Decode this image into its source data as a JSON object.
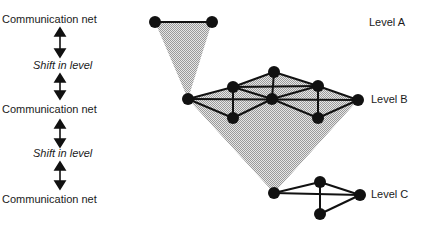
{
  "left_column": {
    "labels": [
      {
        "text": "Communication net",
        "style": "normal"
      },
      {
        "text": "Shift in level",
        "style": "italic"
      },
      {
        "text": "Communication net",
        "style": "normal"
      },
      {
        "text": "Shift in level",
        "style": "italic"
      },
      {
        "text": "Communication net",
        "style": "normal"
      }
    ],
    "arrow_icon": "double-headed-vertical-arrow"
  },
  "levels": [
    {
      "label": "Level A"
    },
    {
      "label": "Level B"
    },
    {
      "label": "Level C"
    }
  ],
  "colors": {
    "node": "#111111",
    "edge": "#111111",
    "shade": "#c8c8c8",
    "text": "#1a1a1a"
  },
  "networks": {
    "level_a": {
      "nodes": [
        [
          155,
          22
        ],
        [
          212,
          22
        ]
      ],
      "edges": [
        [
          0,
          1
        ]
      ]
    },
    "level_b": {
      "nodes": {
        "L": [
          188,
          99
        ],
        "TL": [
          233,
          87
        ],
        "BL": [
          233,
          118
        ],
        "T": [
          274,
          72
        ],
        "C": [
          272,
          99
        ],
        "TR": [
          318,
          86
        ],
        "BR": [
          318,
          118
        ],
        "R": [
          358,
          100
        ]
      },
      "edges": [
        [
          "L",
          "TL"
        ],
        [
          "L",
          "BL"
        ],
        [
          "L",
          "C"
        ],
        [
          "C",
          "R"
        ],
        [
          "TL",
          "T"
        ],
        [
          "T",
          "TR"
        ],
        [
          "TL",
          "TR"
        ],
        [
          "TL",
          "C"
        ],
        [
          "T",
          "C"
        ],
        [
          "C",
          "TR"
        ],
        [
          "TL",
          "BL"
        ],
        [
          "TR",
          "BR"
        ],
        [
          "BL",
          "C"
        ],
        [
          "C",
          "BR"
        ],
        [
          "TR",
          "R"
        ],
        [
          "BR",
          "R"
        ]
      ]
    },
    "level_c": {
      "nodes": {
        "L": [
          274,
          193
        ],
        "T": [
          320,
          182
        ],
        "B": [
          320,
          214
        ],
        "R": [
          360,
          195
        ]
      },
      "edges": [
        [
          "L",
          "T"
        ],
        [
          "L",
          "R"
        ],
        [
          "T",
          "R"
        ],
        [
          "T",
          "B"
        ],
        [
          "B",
          "R"
        ]
      ]
    }
  }
}
